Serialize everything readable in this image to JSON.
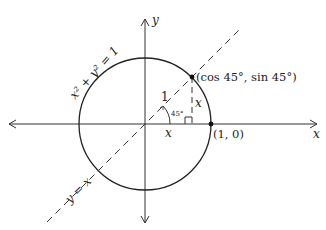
{
  "diagram": {
    "axes": {
      "x_label": "x",
      "y_label": "y"
    },
    "circle_label": "x² + y² = 1",
    "line_label": "y = x",
    "point_label": "(cos 45°, sin 45°)",
    "intercept_label": "(1, 0)",
    "hypotenuse_label": "1",
    "angle_label": "45°",
    "base_label": "x",
    "height_label": "x",
    "colors": {
      "stroke": "#222222",
      "background": "#ffffff"
    }
  }
}
